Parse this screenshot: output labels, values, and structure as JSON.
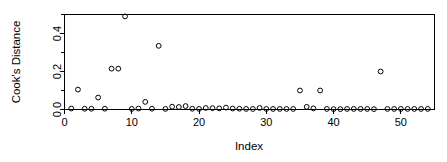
{
  "chart_data": {
    "type": "scatter",
    "title": "",
    "xlabel": "Index",
    "ylabel": "Cook's Distance",
    "xlim": [
      0,
      55
    ],
    "ylim": [
      0.0,
      0.5
    ],
    "grid": false,
    "legend": null,
    "marker": "open-circle",
    "xticks": [
      0,
      10,
      20,
      30,
      40,
      50
    ],
    "xtick_labels": [
      "0",
      "10",
      "20",
      "30",
      "40",
      "50"
    ],
    "yticks": [
      0.0,
      0.1,
      0.2,
      0.3,
      0.4,
      0.5
    ],
    "ytick_labels": [
      "0.0",
      "",
      "0.2",
      "",
      "0.4",
      ""
    ],
    "x": [
      1,
      2,
      3,
      4,
      5,
      6,
      7,
      8,
      9,
      10,
      11,
      12,
      13,
      14,
      15,
      16,
      17,
      18,
      19,
      20,
      21,
      22,
      23,
      24,
      25,
      26,
      27,
      28,
      29,
      30,
      31,
      32,
      33,
      34,
      35,
      36,
      37,
      38,
      39,
      40,
      41,
      42,
      43,
      44,
      45,
      46,
      47,
      48,
      49,
      50,
      51,
      52,
      53,
      54
    ],
    "y": [
      0.005,
      0.105,
      0.004,
      0.004,
      0.063,
      0.004,
      0.215,
      0.215,
      0.49,
      0.003,
      0.005,
      0.04,
      0.004,
      0.335,
      0.003,
      0.015,
      0.013,
      0.018,
      0.004,
      0.003,
      0.008,
      0.007,
      0.006,
      0.01,
      0.005,
      0.004,
      0.003,
      0.003,
      0.008,
      0.003,
      0.003,
      0.003,
      0.003,
      0.003,
      0.1,
      0.014,
      0.006,
      0.1,
      0.003,
      0.002,
      0.002,
      0.003,
      0.003,
      0.003,
      0.003,
      0.002,
      0.2,
      0.003,
      0.003,
      0.003,
      0.003,
      0.003,
      0.003,
      0.003
    ]
  },
  "axes": {
    "y_label": "Cook's Distance",
    "x_label": "Index"
  }
}
